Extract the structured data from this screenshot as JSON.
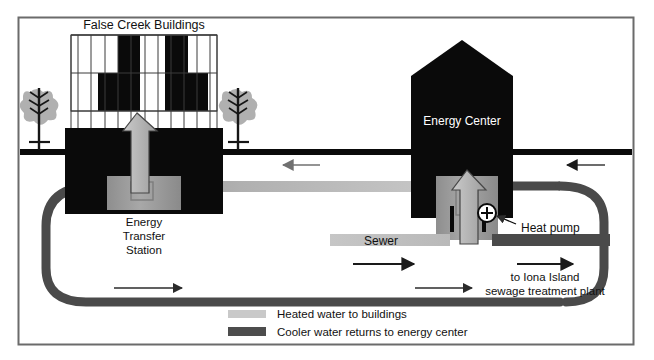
{
  "diagram": {
    "frame": {
      "border_color": "#6b6b6b",
      "background": "#ffffff"
    },
    "labels": {
      "buildings_title": "False Creek Buildings",
      "energy_center": "Energy Center",
      "energy_transfer_station_line1": "Energy",
      "energy_transfer_station_line2": "Transfer",
      "energy_transfer_station_line3": "Station",
      "heat_pump": "Heat pump",
      "sewer": "Sewer",
      "destination_line1": "to Iona Island",
      "destination_line2": "sewage treatment plant"
    },
    "legend": {
      "items": [
        {
          "swatch_color": "#c9c9c9",
          "label": "Heated water to buildings"
        },
        {
          "swatch_color": "#4d4d4d",
          "label": "Cooler water returns to energy center"
        }
      ]
    },
    "colors": {
      "building_solid": "#0a0a0a",
      "ground_line": "#0a0a0a",
      "hot_pipe": "#c4c4c4",
      "cold_pipe": "#4a4a4a",
      "sewer_pipe_light": "#c4c4c4",
      "sewer_pipe_dark": "#4a4a4a",
      "arrow_fill": "#b5b5b5",
      "arrow_stroke": "#3a3a3a",
      "tree_foliage": "#b0b0b0",
      "tree_trunk": "#161616",
      "transfer_box": "#9a9a9a",
      "frame_border": "#6b6b6b"
    },
    "icons": {
      "heat_pump_symbol": "plus-in-circle-icon",
      "tree": "tree-icon",
      "up_arrow": "up-arrow-icon",
      "flow_arrow_right": "arrow-right-icon",
      "flow_arrow_left": "arrow-left-icon"
    },
    "flow_arrows": [
      {
        "name": "cold-return-top-left",
        "direction": "left"
      },
      {
        "name": "cold-return-top-right",
        "direction": "left"
      },
      {
        "name": "cold-return-bottom-left",
        "direction": "right"
      },
      {
        "name": "sewer-inflow",
        "direction": "right"
      },
      {
        "name": "cold-return-bottom-mid",
        "direction": "right"
      },
      {
        "name": "sewer-outflow",
        "direction": "right"
      }
    ]
  }
}
